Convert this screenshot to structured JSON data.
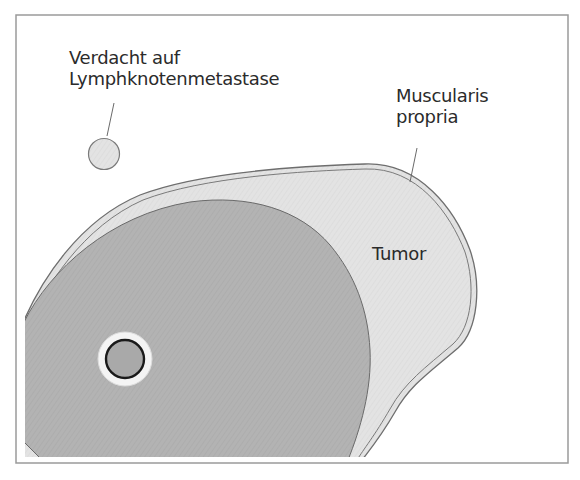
{
  "diagram": {
    "type": "anatomical-schematic",
    "labels": {
      "lymph_node": {
        "line1": "Verdacht auf",
        "line2": "Lymphknotenmetastase"
      },
      "muscularis": {
        "line1": "Muscularis",
        "line2": "propria"
      },
      "tumor": "Tumor"
    },
    "colors": {
      "frame": "#9a9a9a",
      "wall_light": "#e2e2e2",
      "tumor_dark": "#b3b3b3",
      "outline": "#6e6e6e",
      "lumen_fill": "#a9a9a9",
      "lumen_ring": "#1a1a1a",
      "halo": "#f4f4f4",
      "text": "#2b2b2b"
    }
  }
}
